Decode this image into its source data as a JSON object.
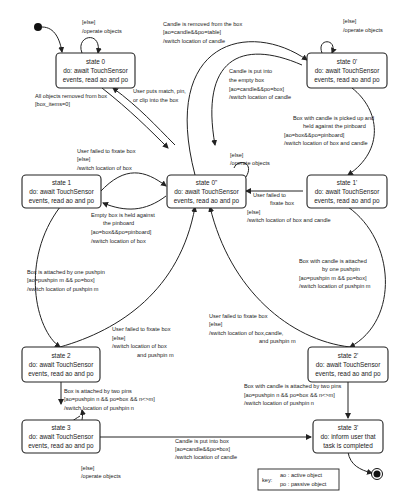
{
  "diagram": {
    "type": "UML state machine",
    "states": [
      {
        "id": "s0",
        "lines": [
          "state 0",
          "do: await TouchSensor",
          "events, read ao and po"
        ]
      },
      {
        "id": "s0p",
        "lines": [
          "state 0'",
          "do: await TouchSensor",
          "events, read ao and po"
        ]
      },
      {
        "id": "s0pp",
        "lines": [
          "state 0\"",
          "do: await TouchSensor",
          "events, read ao and po"
        ]
      },
      {
        "id": "s1",
        "lines": [
          "state 1",
          "do: await TouchSensor",
          "events, read ao and po"
        ]
      },
      {
        "id": "s1p",
        "lines": [
          "state 1'",
          "do: await TouchSensor",
          "events, read ao and po"
        ]
      },
      {
        "id": "s2",
        "lines": [
          "state 2",
          "do: await TouchSensor",
          "events, read ao and po"
        ]
      },
      {
        "id": "s2p",
        "lines": [
          "state 2'",
          "do: await TouchSensor",
          "events, read ao and po"
        ]
      },
      {
        "id": "s3",
        "lines": [
          "state 3",
          "do: await TouchSensor",
          "events, read ao and po"
        ]
      },
      {
        "id": "s3p",
        "lines": [
          "state 3'",
          "do: inform user that",
          "task is completed"
        ]
      }
    ],
    "labels": {
      "s0_self": [
        "[else]",
        "/operate objects"
      ],
      "s0p_self": [
        "[else]",
        "/operate objects"
      ],
      "s0pp_self": [
        "[else]",
        "/operate objects"
      ],
      "s3_self": [
        "[else]",
        "/operate objects"
      ],
      "candle_removed": [
        "Candle is removed from the box",
        "[ao=candle&&po=table]",
        "/switch location of candle"
      ],
      "candle_put_empty": [
        "Candle is put into",
        "the empty box",
        "[ao=candle&&po=box]",
        "/switch location of candle"
      ],
      "all_removed": [
        "All objects removed from box",
        "[box_items=0]"
      ],
      "user_puts": [
        "User puts match, pin,",
        "or clip into the box"
      ],
      "box_candle_picked": [
        "Box with candle is picked up and",
        "held against the pinboard",
        "[ao=box&&po=pinboard]",
        "/switch location of box and candle"
      ],
      "fail_fix_1": [
        "User failed to fixate box",
        "[else]",
        "/switch location of box"
      ],
      "empty_box_held": [
        "Empty box is held against",
        "the pinboard",
        "[ao=box&&po=pinboard]",
        "/switch location of box"
      ],
      "fail_fix_1p": [
        "User failed to",
        "fixate box"
      ],
      "fail_fix_1p_guard": [
        "[else]",
        "/switch location of box and candle"
      ],
      "attached_one": [
        "Box is attached by one pushpin",
        "[ao=pushpin m && po=box]",
        "/switch location of pushpin m"
      ],
      "candle_attached_one": [
        "Box with candle is attached",
        "by one pushpin",
        "[ao=pushpin m && po=box]",
        "/switch location of pushpin m"
      ],
      "fail_fix_2": [
        "User failed to fixate box",
        "[else]",
        "/switch location of box",
        "and pushpin m"
      ],
      "fail_fix_2p": [
        "User failed to fixate box",
        "[else]",
        "/switch location of box,candle,",
        "and pushpin m"
      ],
      "attached_two": [
        "Box is attached by two pins",
        "[ao=pushpin n && po=box && n<>m]",
        "/switch location of pushpin n"
      ],
      "candle_attached_two": [
        "Box with candle is attached by two pins",
        "[ao=pushpin n && po=box && n<>m]",
        "/switch location of pushpin n"
      ],
      "candle_put_box": [
        "Candle is put into box",
        "[ao=candle&&po=box]",
        "/switch location of candle"
      ]
    },
    "key": {
      "title": "key:",
      "lines": [
        "ao : active object",
        "po : passive object"
      ]
    }
  }
}
